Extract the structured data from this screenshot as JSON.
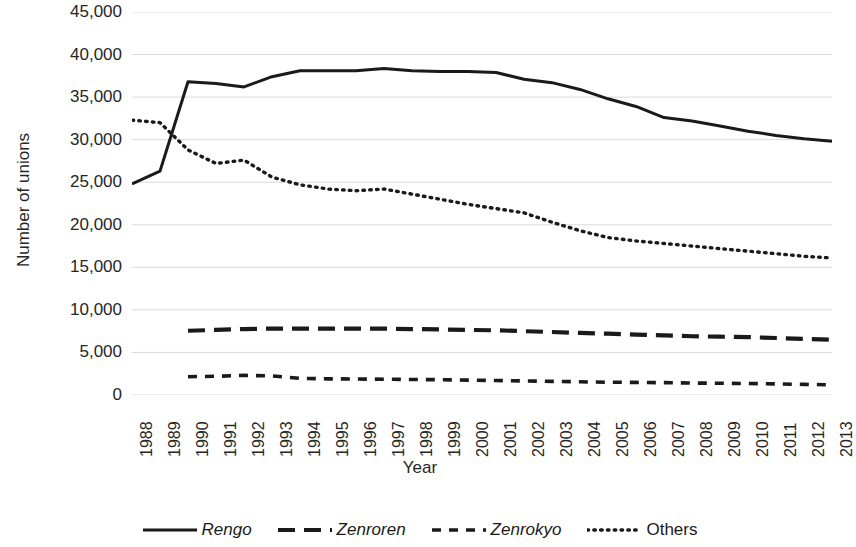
{
  "chart_data": {
    "type": "line",
    "title": "",
    "xlabel": "Year",
    "ylabel": "Number of unions",
    "x": [
      1988,
      1989,
      1990,
      1991,
      1992,
      1993,
      1994,
      1995,
      1996,
      1997,
      1998,
      1999,
      2000,
      2001,
      2002,
      2003,
      2004,
      2005,
      2006,
      2007,
      2008,
      2009,
      2010,
      2011,
      2012,
      2013
    ],
    "xtick_labels": [
      "1988",
      "1989",
      "1990",
      "1991",
      "1992",
      "1993",
      "1994",
      "1995",
      "1996",
      "1997",
      "1998",
      "1999",
      "2000",
      "2001",
      "2002",
      "2003",
      "2004",
      "2005",
      "2006",
      "2007",
      "2008",
      "2009",
      "2010",
      "2011",
      "2012",
      "2013"
    ],
    "ytick_labels": [
      "45,000",
      "40,000",
      "35,000",
      "30,000",
      "25,000",
      "20,000",
      "15,000",
      "10,000",
      "5,000",
      "0"
    ],
    "ytick_values": [
      45000,
      40000,
      35000,
      30000,
      25000,
      20000,
      15000,
      10000,
      5000,
      0
    ],
    "ylim": [
      0,
      45000
    ],
    "xlim": [
      1988,
      2013
    ],
    "grid": true,
    "grid_axis": "y",
    "legend_position": "bottom",
    "series": [
      {
        "name": "Rengo",
        "style": "solid",
        "color": "#1a1a1a",
        "label_italic": true,
        "x": [
          1988,
          1989,
          1990,
          1991,
          1992,
          1993,
          1994,
          1995,
          1996,
          1997,
          1998,
          1999,
          2000,
          2001,
          2002,
          2003,
          2004,
          2005,
          2006,
          2007,
          2008,
          2009,
          2010,
          2011,
          2012,
          2013
        ],
        "values": [
          24800,
          26300,
          36800,
          36600,
          36200,
          37400,
          38100,
          38100,
          38100,
          38350,
          38100,
          38000,
          38000,
          37900,
          37100,
          36700,
          35900,
          34800,
          33900,
          32600,
          32200,
          31600,
          31000,
          30500,
          30100,
          29800
        ]
      },
      {
        "name": "Zenroren",
        "style": "long-dash",
        "color": "#1a1a1a",
        "label_italic": true,
        "x": [
          1990,
          1991,
          1992,
          1993,
          1994,
          1995,
          1996,
          1997,
          1998,
          1999,
          2000,
          2001,
          2002,
          2003,
          2004,
          2005,
          2006,
          2007,
          2008,
          2009,
          2010,
          2011,
          2012,
          2013
        ],
        "values": [
          7550,
          7650,
          7750,
          7800,
          7800,
          7800,
          7800,
          7800,
          7750,
          7700,
          7650,
          7600,
          7500,
          7400,
          7300,
          7200,
          7100,
          7000,
          6900,
          6850,
          6800,
          6700,
          6600,
          6500
        ]
      },
      {
        "name": "Zenrokyo",
        "style": "short-dash",
        "color": "#1a1a1a",
        "label_italic": true,
        "x": [
          1990,
          1991,
          1992,
          1993,
          1994,
          1995,
          1996,
          1997,
          1998,
          1999,
          2000,
          2001,
          2002,
          2003,
          2004,
          2005,
          2006,
          2007,
          2008,
          2009,
          2010,
          2011,
          2012,
          2013
        ],
        "values": [
          2150,
          2200,
          2300,
          2250,
          1950,
          1900,
          1880,
          1850,
          1820,
          1800,
          1750,
          1700,
          1650,
          1600,
          1550,
          1500,
          1480,
          1450,
          1400,
          1380,
          1350,
          1300,
          1250,
          1200
        ]
      },
      {
        "name": "Others",
        "style": "dotted",
        "color": "#1a1a1a",
        "label_italic": false,
        "x": [
          1988,
          1989,
          1990,
          1991,
          1992,
          1993,
          1994,
          1995,
          1996,
          1997,
          1998,
          1999,
          2000,
          2001,
          2002,
          2003,
          2004,
          2005,
          2006,
          2007,
          2008,
          2009,
          2010,
          2011,
          2012,
          2013
        ],
        "values": [
          32300,
          32000,
          28800,
          27200,
          27600,
          25600,
          24700,
          24200,
          24000,
          24200,
          23600,
          23000,
          22400,
          21900,
          21400,
          20300,
          19300,
          18500,
          18100,
          17800,
          17500,
          17200,
          16900,
          16600,
          16300,
          16100
        ]
      }
    ]
  },
  "legend": {
    "items": [
      {
        "label": "Rengo",
        "swatch": "solid-line-swatch"
      },
      {
        "label": "Zenroren",
        "swatch": "long-dash-line-swatch"
      },
      {
        "label": "Zenrokyo",
        "swatch": "short-dash-line-swatch"
      },
      {
        "label": "Others",
        "swatch": "dotted-line-swatch"
      }
    ]
  }
}
